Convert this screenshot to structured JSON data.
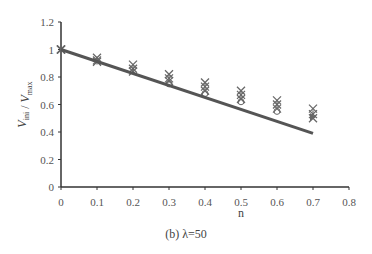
{
  "caption": "(b) λ=50",
  "colors": {
    "axis": "#333333",
    "fit_line": "#555555",
    "marker": "#666666"
  },
  "chart_data": {
    "type": "scatter",
    "title": "",
    "xlabel": "n",
    "ylabel": "V_ini / V_max",
    "xlim": [
      0,
      0.8
    ],
    "ylim": [
      0,
      1.2
    ],
    "x_ticks": [
      0,
      0.1,
      0.2,
      0.3,
      0.4,
      0.5,
      0.6,
      0.7,
      0.8
    ],
    "x_tick_labels": [
      "0",
      "0.1",
      "0.2",
      "0.3",
      "0.4",
      "0.5",
      "0.6",
      "0.7",
      "0.8"
    ],
    "y_ticks": [
      0,
      0.2,
      0.4,
      0.6,
      0.8,
      1.0,
      1.2
    ],
    "y_tick_labels": [
      "0",
      "0.2",
      "0.4",
      "0.6",
      "0.8",
      "1",
      "1.2"
    ],
    "grid": false,
    "legend": null,
    "series": [
      {
        "name": "series-x",
        "marker": "x",
        "x": [
          0,
          0.1,
          0.2,
          0.3,
          0.4,
          0.5,
          0.6,
          0.7
        ],
        "y": [
          1.0,
          0.94,
          0.89,
          0.82,
          0.76,
          0.7,
          0.63,
          0.57
        ]
      },
      {
        "name": "series-star",
        "marker": "star",
        "x": [
          0,
          0.1,
          0.2,
          0.3,
          0.4,
          0.5,
          0.6,
          0.7
        ],
        "y": [
          1.0,
          0.92,
          0.86,
          0.79,
          0.73,
          0.67,
          0.6,
          0.53
        ]
      },
      {
        "name": "series-x2",
        "marker": "x",
        "x": [
          0,
          0.1,
          0.2,
          0.3,
          0.4,
          0.5,
          0.6,
          0.7
        ],
        "y": [
          1.0,
          0.91,
          0.84,
          0.77,
          0.7,
          0.64,
          0.57,
          0.5
        ]
      },
      {
        "name": "series-circle",
        "marker": "circle",
        "x": [
          0.3,
          0.4,
          0.5,
          0.6
        ],
        "y": [
          0.75,
          0.68,
          0.62,
          0.55
        ]
      },
      {
        "name": "series-triangle",
        "marker": "triangle",
        "x": [
          0.7
        ],
        "y": [
          0.51
        ]
      }
    ],
    "fit_line": {
      "x": [
        0,
        0.7
      ],
      "y": [
        1.0,
        0.39
      ]
    }
  }
}
